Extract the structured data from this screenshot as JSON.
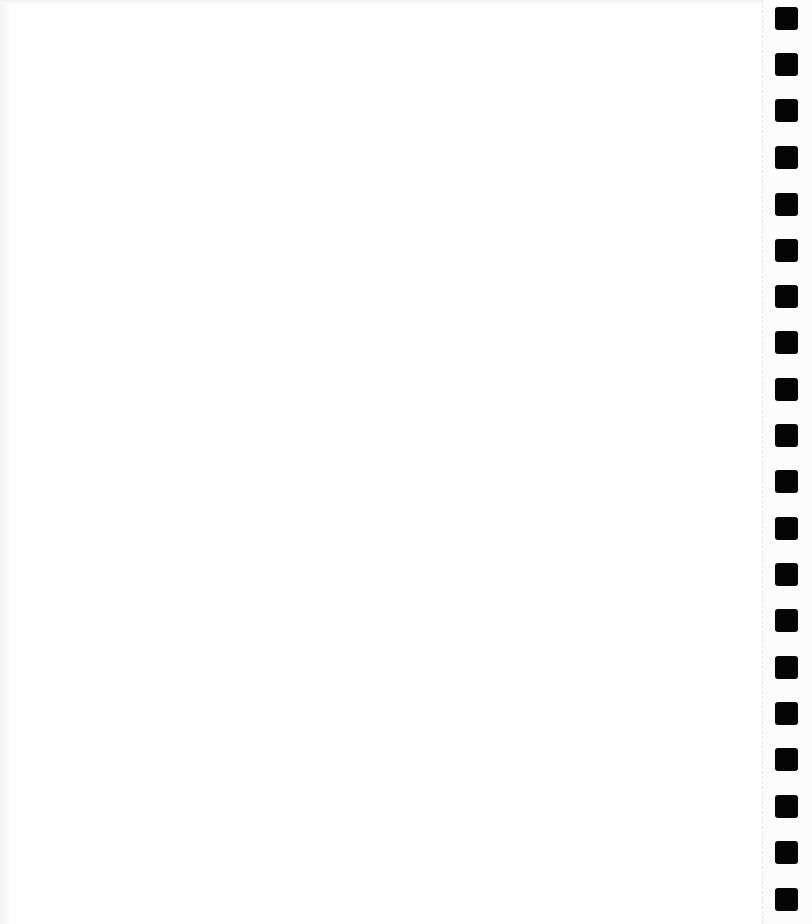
{
  "page": {
    "type": "blank-notebook-page",
    "background": "#fefefe",
    "text_lines": []
  },
  "binding": {
    "side": "right",
    "hole_color": "#050505",
    "hole_count": 20,
    "holes": [
      {
        "top": 7
      },
      {
        "top": 53
      },
      {
        "top": 99
      },
      {
        "top": 146
      },
      {
        "top": 193
      },
      {
        "top": 239
      },
      {
        "top": 285
      },
      {
        "top": 331
      },
      {
        "top": 378
      },
      {
        "top": 424
      },
      {
        "top": 470
      },
      {
        "top": 517
      },
      {
        "top": 563
      },
      {
        "top": 609
      },
      {
        "top": 656
      },
      {
        "top": 702
      },
      {
        "top": 748
      },
      {
        "top": 795
      },
      {
        "top": 841
      },
      {
        "top": 888
      }
    ]
  }
}
